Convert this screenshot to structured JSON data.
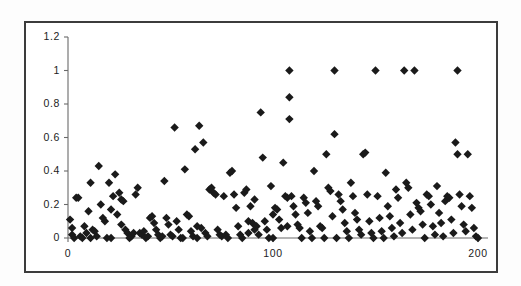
{
  "figure": {
    "name": "scatter-plot-figure",
    "background_color": "#ffffff",
    "frame_color": "#3c3c3c"
  },
  "chart_data": {
    "type": "scatter",
    "title": "",
    "subtitle": "",
    "xlabel": "",
    "ylabel": "",
    "xlim": [
      0,
      205
    ],
    "ylim": [
      0,
      1.2
    ],
    "xticks": [
      0,
      100,
      200
    ],
    "xtick_labels": [
      "0",
      "100",
      "200"
    ],
    "yticks": [
      0,
      0.2,
      0.4,
      0.6,
      0.8,
      1,
      1.2
    ],
    "ytick_labels": [
      "0",
      "0.2",
      "0.4",
      "0.6",
      "0.8",
      "1",
      "1.2"
    ],
    "grid": false,
    "legend": null,
    "marker": "diamond",
    "marker_color": "#1a1a1a",
    "marker_size": 6,
    "series": [
      {
        "name": "series-1",
        "points": [
          [
            1,
            0.11
          ],
          [
            2,
            0.06
          ],
          [
            2,
            0.02
          ],
          [
            3,
            0.0
          ],
          [
            4,
            0.24
          ],
          [
            5,
            0.24
          ],
          [
            6,
            0.01
          ],
          [
            7,
            0.0
          ],
          [
            8,
            0.07
          ],
          [
            9,
            0.03
          ],
          [
            10,
            0.16
          ],
          [
            11,
            0.33
          ],
          [
            11,
            0.0
          ],
          [
            12,
            0.05
          ],
          [
            13,
            0.04
          ],
          [
            14,
            0.01
          ],
          [
            15,
            0.43
          ],
          [
            16,
            0.2
          ],
          [
            17,
            0.12
          ],
          [
            18,
            0.1
          ],
          [
            19,
            0.0
          ],
          [
            20,
            0.33
          ],
          [
            21,
            0.17
          ],
          [
            21,
            0.0
          ],
          [
            22,
            0.25
          ],
          [
            23,
            0.38
          ],
          [
            24,
            0.14
          ],
          [
            25,
            0.27
          ],
          [
            26,
            0.23
          ],
          [
            26,
            0.08
          ],
          [
            27,
            0.22
          ],
          [
            28,
            0.05
          ],
          [
            29,
            0.03
          ],
          [
            30,
            0.0
          ],
          [
            31,
            0.01
          ],
          [
            32,
            0.03
          ],
          [
            33,
            0.26
          ],
          [
            34,
            0.3
          ],
          [
            35,
            0.03
          ],
          [
            36,
            0.02
          ],
          [
            37,
            0.04
          ],
          [
            38,
            0.0
          ],
          [
            39,
            0.01
          ],
          [
            40,
            0.12
          ],
          [
            41,
            0.13
          ],
          [
            42,
            0.09
          ],
          [
            43,
            0.05
          ],
          [
            44,
            0.02
          ],
          [
            45,
            0.0
          ],
          [
            46,
            0.01
          ],
          [
            47,
            0.34
          ],
          [
            48,
            0.12
          ],
          [
            49,
            0.08
          ],
          [
            50,
            0.02
          ],
          [
            51,
            0.01
          ],
          [
            52,
            0.66
          ],
          [
            53,
            0.1
          ],
          [
            54,
            0.05
          ],
          [
            55,
            0.0
          ],
          [
            56,
            0.0
          ],
          [
            57,
            0.41
          ],
          [
            58,
            0.14
          ],
          [
            59,
            0.13
          ],
          [
            60,
            0.04
          ],
          [
            61,
            0.01
          ],
          [
            62,
            0.53
          ],
          [
            63,
            0.07
          ],
          [
            63,
            0.0
          ],
          [
            64,
            0.67
          ],
          [
            65,
            0.06
          ],
          [
            66,
            0.57
          ],
          [
            67,
            0.03
          ],
          [
            68,
            0.01
          ],
          [
            69,
            0.29
          ],
          [
            70,
            0.3
          ],
          [
            71,
            0.27
          ],
          [
            72,
            0.26
          ],
          [
            73,
            0.05
          ],
          [
            74,
            0.02
          ],
          [
            75,
            0.01
          ],
          [
            76,
            0.25
          ],
          [
            77,
            0.02
          ],
          [
            78,
            0.0
          ],
          [
            79,
            0.39
          ],
          [
            80,
            0.4
          ],
          [
            81,
            0.26
          ],
          [
            82,
            0.18
          ],
          [
            83,
            0.07
          ],
          [
            84,
            0.02
          ],
          [
            85,
            0.0
          ],
          [
            86,
            0.27
          ],
          [
            87,
            0.29
          ],
          [
            88,
            0.1
          ],
          [
            88,
            0.03
          ],
          [
            89,
            0.19
          ],
          [
            90,
            0.09
          ],
          [
            91,
            0.23
          ],
          [
            91,
            0.05
          ],
          [
            92,
            0.07
          ],
          [
            93,
            0.02
          ],
          [
            94,
            0.75
          ],
          [
            95,
            0.48
          ],
          [
            96,
            0.1
          ],
          [
            97,
            0.05
          ],
          [
            98,
            0.0
          ],
          [
            99,
            0.31
          ],
          [
            100,
            0.14
          ],
          [
            100,
            0.0
          ],
          [
            101,
            0.18
          ],
          [
            102,
            0.17
          ],
          [
            103,
            0.11
          ],
          [
            104,
            0.06
          ],
          [
            105,
            0.45
          ],
          [
            106,
            0.25
          ],
          [
            107,
            0.24
          ],
          [
            107,
            0.07
          ],
          [
            108,
            1.0
          ],
          [
            108,
            0.84
          ],
          [
            108,
            0.71
          ],
          [
            109,
            0.25
          ],
          [
            110,
            0.19
          ],
          [
            111,
            0.14
          ],
          [
            112,
            0.08
          ],
          [
            113,
            0.06
          ],
          [
            114,
            0.0
          ],
          [
            115,
            0.24
          ],
          [
            116,
            0.21
          ],
          [
            117,
            0.15
          ],
          [
            118,
            0.04
          ],
          [
            119,
            0.0
          ],
          [
            120,
            0.4
          ],
          [
            121,
            0.22
          ],
          [
            122,
            0.19
          ],
          [
            123,
            0.07
          ],
          [
            124,
            0.06
          ],
          [
            125,
            0.0
          ],
          [
            126,
            0.5
          ],
          [
            127,
            0.3
          ],
          [
            128,
            0.28
          ],
          [
            129,
            0.13
          ],
          [
            130,
            1.0
          ],
          [
            130,
            0.62
          ],
          [
            131,
            0.0
          ],
          [
            132,
            0.26
          ],
          [
            133,
            0.22
          ],
          [
            134,
            0.17
          ],
          [
            135,
            0.09
          ],
          [
            136,
            0.04
          ],
          [
            137,
            0.0
          ],
          [
            138,
            0.33
          ],
          [
            139,
            0.25
          ],
          [
            140,
            0.15
          ],
          [
            141,
            0.11
          ],
          [
            142,
            0.05
          ],
          [
            143,
            0.02
          ],
          [
            144,
            0.5
          ],
          [
            145,
            0.51
          ],
          [
            146,
            0.26
          ],
          [
            147,
            0.1
          ],
          [
            148,
            0.03
          ],
          [
            149,
            0.0
          ],
          [
            150,
            1.0
          ],
          [
            151,
            0.25
          ],
          [
            152,
            0.12
          ],
          [
            153,
            0.04
          ],
          [
            154,
            0.0
          ],
          [
            155,
            0.39
          ],
          [
            156,
            0.19
          ],
          [
            157,
            0.13
          ],
          [
            158,
            0.06
          ],
          [
            159,
            0.01
          ],
          [
            160,
            0.29
          ],
          [
            161,
            0.24
          ],
          [
            162,
            0.09
          ],
          [
            163,
            0.03
          ],
          [
            164,
            1.0
          ],
          [
            165,
            0.33
          ],
          [
            166,
            0.3
          ],
          [
            167,
            0.14
          ],
          [
            168,
            0.05
          ],
          [
            169,
            1.0
          ],
          [
            170,
            0.21
          ],
          [
            171,
            0.18
          ],
          [
            172,
            0.16
          ],
          [
            173,
            0.08
          ],
          [
            174,
            0.0
          ],
          [
            175,
            0.26
          ],
          [
            176,
            0.25
          ],
          [
            177,
            0.2
          ],
          [
            178,
            0.07
          ],
          [
            179,
            0.02
          ],
          [
            180,
            0.31
          ],
          [
            181,
            0.15
          ],
          [
            182,
            0.09
          ],
          [
            183,
            0.01
          ],
          [
            184,
            0.22
          ],
          [
            185,
            0.25
          ],
          [
            186,
            0.24
          ],
          [
            187,
            0.11
          ],
          [
            188,
            0.03
          ],
          [
            189,
            0.57
          ],
          [
            190,
            1.0
          ],
          [
            190,
            0.5
          ],
          [
            191,
            0.26
          ],
          [
            192,
            0.19
          ],
          [
            193,
            0.08
          ],
          [
            194,
            0.04
          ],
          [
            195,
            0.5
          ],
          [
            196,
            0.25
          ],
          [
            197,
            0.18
          ],
          [
            198,
            0.06
          ],
          [
            199,
            0.01
          ],
          [
            200,
            0.0
          ]
        ]
      }
    ]
  }
}
